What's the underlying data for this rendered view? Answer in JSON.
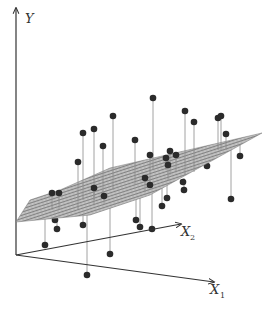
{
  "figure": {
    "axes": {
      "y_label": "Y",
      "x1_label": "X",
      "x1_sub": "1",
      "x2_label": "X",
      "x2_sub": "2"
    },
    "colors": {
      "axis": "#333333",
      "point": "#2b2b2b",
      "residual": "#8a8a8a",
      "plane_fill": "#bdbdbd",
      "plane_mesh": "#6e6e6e"
    },
    "geometry": {
      "origin": [
        16,
        255
      ],
      "y_axis_top": [
        16,
        8
      ],
      "x1_axis_end": [
        214,
        282
      ],
      "x2_axis_end": [
        181,
        224
      ],
      "plane_corners": [
        [
          16,
          222
        ],
        [
          88,
          193
        ],
        [
          262,
          133
        ],
        [
          188,
          162
        ]
      ],
      "plane_top_edge": [
        [
          16,
          222
        ],
        [
          30,
          200
        ],
        [
          60,
          190
        ],
        [
          110,
          168
        ],
        [
          262,
          133
        ]
      ],
      "plane_bottom_edge": [
        [
          16,
          222
        ],
        [
          90,
          215
        ],
        [
          150,
          195
        ],
        [
          262,
          133
        ]
      ]
    },
    "points": [
      {
        "x": 153,
        "y": 98,
        "base": 170
      },
      {
        "x": 83,
        "y": 133,
        "base": 200
      },
      {
        "x": 94,
        "y": 129,
        "base": 200
      },
      {
        "x": 113,
        "y": 116,
        "base": 190
      },
      {
        "x": 103,
        "y": 146,
        "base": 195
      },
      {
        "x": 78,
        "y": 162,
        "base": 210
      },
      {
        "x": 185,
        "y": 111,
        "base": 175
      },
      {
        "x": 194,
        "y": 122,
        "base": 172
      },
      {
        "x": 218,
        "y": 118,
        "base": 150
      },
      {
        "x": 221,
        "y": 116,
        "base": 150
      },
      {
        "x": 226,
        "y": 134,
        "base": 150
      },
      {
        "x": 135,
        "y": 140,
        "base": 185
      },
      {
        "x": 150,
        "y": 155,
        "base": 185
      },
      {
        "x": 170,
        "y": 151,
        "base": 175
      },
      {
        "x": 176,
        "y": 155,
        "base": 172
      },
      {
        "x": 166,
        "y": 158,
        "base": 170
      },
      {
        "x": 52,
        "y": 193,
        "base": 210
      },
      {
        "x": 59,
        "y": 193,
        "base": 210
      },
      {
        "x": 94,
        "y": 188,
        "base": 205
      },
      {
        "x": 104,
        "y": 196,
        "base": 205
      },
      {
        "x": 145,
        "y": 178,
        "base": 192
      },
      {
        "x": 168,
        "y": 165,
        "base": 180
      },
      {
        "x": 183,
        "y": 182,
        "base": 180
      },
      {
        "x": 207,
        "y": 156,
        "base": 150
      },
      {
        "x": 207,
        "y": 166,
        "base": 150
      },
      {
        "x": 240,
        "y": 156,
        "base": 140
      },
      {
        "x": 55,
        "y": 220,
        "base": 210
      },
      {
        "x": 57,
        "y": 229,
        "base": 210
      },
      {
        "x": 45,
        "y": 245,
        "base": 215
      },
      {
        "x": 83,
        "y": 225,
        "base": 205
      },
      {
        "x": 150,
        "y": 185,
        "base": 188
      },
      {
        "x": 167,
        "y": 198,
        "base": 180
      },
      {
        "x": 162,
        "y": 206,
        "base": 185
      },
      {
        "x": 184,
        "y": 190,
        "base": 178
      },
      {
        "x": 231,
        "y": 199,
        "base": 150
      },
      {
        "x": 136,
        "y": 220,
        "base": 195
      },
      {
        "x": 140,
        "y": 227,
        "base": 195
      },
      {
        "x": 152,
        "y": 229,
        "base": 190
      },
      {
        "x": 110,
        "y": 254,
        "base": 202
      },
      {
        "x": 87,
        "y": 275,
        "base": 205
      }
    ]
  }
}
